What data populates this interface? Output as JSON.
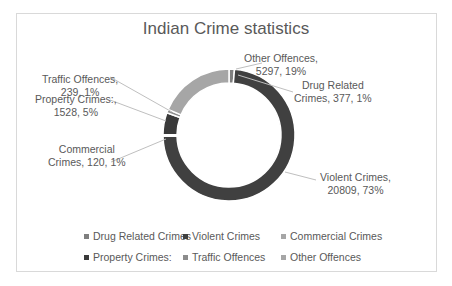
{
  "chart_data": {
    "type": "pie",
    "subtype": "donut",
    "title": "Indian Crime statistics",
    "categories": [
      "Drug Related Crimes",
      "Violent Crimes",
      "Commercial Crimes",
      "Property Crimes:",
      "Traffic Offences",
      "Other Offences"
    ],
    "values": [
      377,
      20809,
      120,
      1528,
      239,
      5297
    ],
    "percentages": [
      1,
      73,
      1,
      5,
      1,
      19
    ],
    "colors": [
      "#7f7f7f",
      "#404040",
      "#a6a6a6",
      "#3a3a3a",
      "#8c8c8c",
      "#a6a6a6"
    ],
    "legend_position": "bottom",
    "data_labels": [
      {
        "line1": "Drug Related",
        "line2": "Crimes, 377, 1%"
      },
      {
        "line1": "Violent Crimes,",
        "line2": "20809, 73%"
      },
      {
        "line1": "Commercial",
        "line2": "Crimes, 120, 1%"
      },
      {
        "line1": "Property Crimes:,",
        "line2": "1528, 5%"
      },
      {
        "line1": "Traffic Offences,",
        "line2": "239, 1%"
      },
      {
        "line1": "Other Offences,",
        "line2": "5297, 19%"
      }
    ]
  },
  "legend": {
    "items": [
      {
        "label": "Drug Related Crimes",
        "color": "#7f7f7f"
      },
      {
        "label": "Violent Crimes",
        "color": "#404040"
      },
      {
        "label": "Commercial Crimes",
        "color": "#a6a6a6"
      },
      {
        "label": "Property Crimes:",
        "color": "#3a3a3a"
      },
      {
        "label": "Traffic Offences",
        "color": "#8c8c8c"
      },
      {
        "label": "Other Offences",
        "color": "#a6a6a6"
      }
    ]
  }
}
